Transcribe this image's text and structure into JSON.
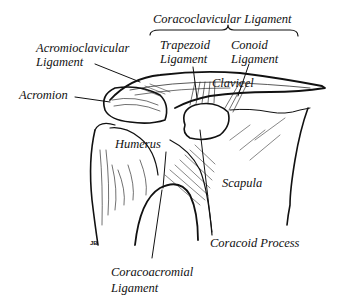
{
  "diagram": {
    "colors": {
      "ink": "#111111",
      "background": "#ffffff"
    },
    "labels": {
      "coracoclavicular": "Coracoclavicular Ligament",
      "trapezoid_line1": "Trapezoid",
      "trapezoid_line2": "Ligament",
      "conoid_line1": "Conoid",
      "conoid_line2": "Ligament",
      "acromioclavicular_line1": "Acromioclavicular",
      "acromioclavicular_line2": "Ligament",
      "clavicle": "Clavicel",
      "acromion": "Acromion",
      "humerus": "Humerus",
      "scapula": "Scapula",
      "coracoid_process": "Coracoid Process",
      "coracoacromial_line1": "Coracoacromial",
      "coracoacromial_line2": "Ligament"
    },
    "signature": "JB"
  }
}
